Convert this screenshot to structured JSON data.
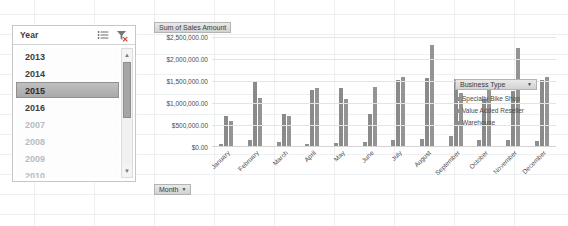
{
  "slicer": {
    "title": "Year",
    "icons": [
      {
        "name": "multi-select-icon"
      },
      {
        "name": "clear-filter-icon"
      }
    ],
    "items": [
      {
        "label": "2013",
        "state": "available"
      },
      {
        "label": "2014",
        "state": "available"
      },
      {
        "label": "2015",
        "state": "selected"
      },
      {
        "label": "2016",
        "state": "available"
      },
      {
        "label": "2007",
        "state": "nodata"
      },
      {
        "label": "2008",
        "state": "nodata"
      },
      {
        "label": "2009",
        "state": "nodata"
      },
      {
        "label": "2010",
        "state": "nodata"
      }
    ],
    "scroll_up": "▲",
    "scroll_down": "▼"
  },
  "chart": {
    "value_field_button": "Sum of Sales Amount",
    "axis_field_button": "Month",
    "caret": "▼",
    "legend_field_button": "Business Type"
  },
  "chart_data": {
    "type": "bar",
    "title": "Sum of Sales Amount",
    "xlabel": "Month",
    "ylabel": "",
    "ylim": [
      0,
      2500000
    ],
    "ytick_labels": [
      "$2,500,000.00",
      "$2,000,000.00",
      "$1,500,000.00",
      "$1,000,000.00",
      "$500,000.00",
      "$0.00"
    ],
    "ytick_values": [
      2500000,
      2000000,
      1500000,
      1000000,
      500000,
      0
    ],
    "grid": true,
    "legend_position": "right",
    "categories": [
      "January",
      "February",
      "March",
      "April",
      "May",
      "June",
      "July",
      "August",
      "September",
      "October",
      "November",
      "December"
    ],
    "series": [
      {
        "name": "Specialty Bike Shop",
        "values": [
          60000,
          150000,
          120000,
          60000,
          90000,
          120000,
          150000,
          180000,
          250000,
          150000,
          170000,
          140000
        ]
      },
      {
        "name": "Value Added Reseller",
        "values": [
          700000,
          1480000,
          740000,
          1290000,
          1340000,
          760000,
          1530000,
          1560000,
          1550000,
          1100000,
          1280000,
          1530000
        ]
      },
      {
        "name": "Warehouse",
        "values": [
          600000,
          1120000,
          710000,
          1350000,
          1080000,
          1360000,
          1580000,
          2320000,
          1230000,
          1430000,
          2240000,
          1600000
        ]
      }
    ]
  }
}
